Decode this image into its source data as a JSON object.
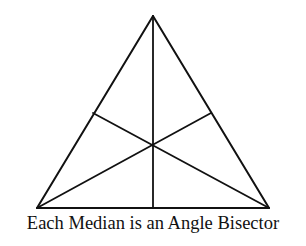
{
  "caption": "Each Median is an Angle Bisector",
  "colors": {
    "line": "#111111",
    "background": "#ffffff"
  },
  "triangle": {
    "type": "equilateral",
    "vertices": {
      "apex": [
        153,
        16
      ],
      "bottom_left": [
        37,
        208
      ],
      "bottom_right": [
        269,
        208
      ]
    },
    "midpoints": {
      "left_side": [
        93,
        113
      ],
      "right_side": [
        211,
        113
      ],
      "base": [
        153,
        208
      ]
    },
    "centroid": [
      153,
      145
    ]
  }
}
